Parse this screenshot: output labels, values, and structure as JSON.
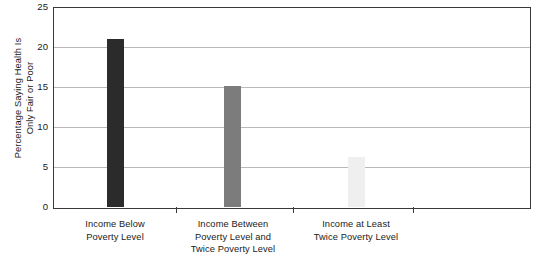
{
  "chart_data": {
    "type": "bar",
    "title": "",
    "xlabel": "",
    "ylabel": "Percentage Saying Health Is\nOnly Fair or Poor",
    "categories": [
      "Income Below\nPoverty Level",
      "Income Between\nPoverty Level and\nTwice Poverty Level",
      "Income at Least\nTwice Poverty Level"
    ],
    "values": [
      21,
      15.1,
      6.3
    ],
    "ylim": [
      0,
      25
    ],
    "yticks": [
      0,
      5,
      10,
      15,
      20,
      25
    ],
    "ytick_labels": [
      "0",
      "5",
      "10",
      "15",
      "20",
      "25"
    ],
    "grid": true,
    "legend": "none",
    "bar_colors": [
      "#2b2b2b",
      "#7c7c7c",
      "#efefef"
    ],
    "gridline_color": "#b9b9b9",
    "axis_color": "#3a3a3a",
    "background_color": "#ffffff"
  },
  "axis": {
    "y_title": "Percentage Saying Health Is\nOnly Fair or Poor",
    "tick_25": "25",
    "tick_20": "20",
    "tick_15": "15",
    "tick_10": "10",
    "tick_5": "5",
    "tick_0": "0"
  },
  "categories": {
    "cat_0": "Income Below\nPoverty Level",
    "cat_1": "Income Between\nPoverty Level and\nTwice Poverty Level",
    "cat_2": "Income at Least\nTwice Poverty Level"
  }
}
